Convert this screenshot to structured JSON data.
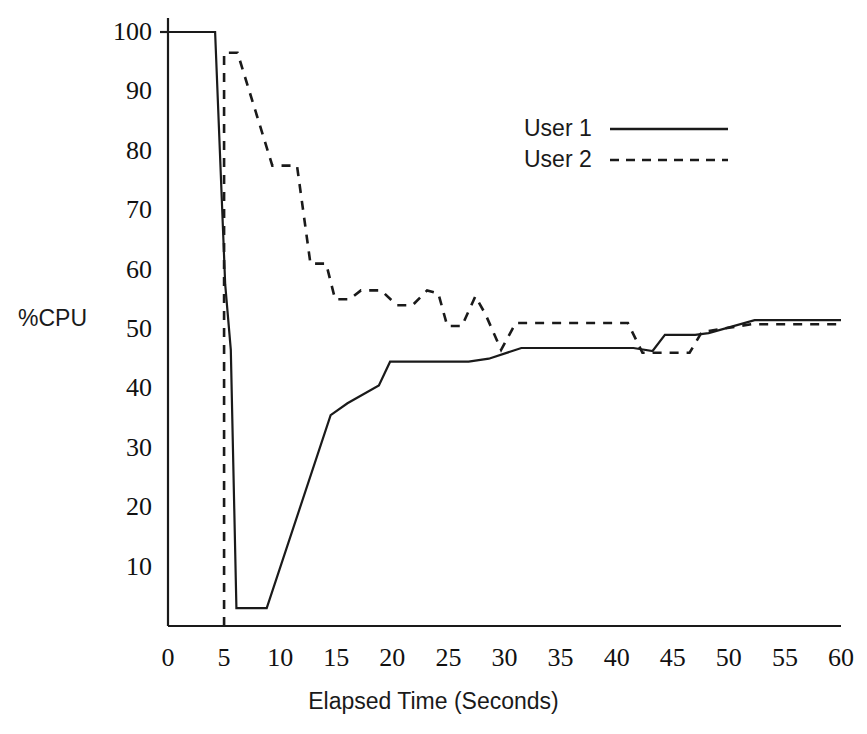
{
  "chart_data": {
    "type": "line",
    "title": "",
    "xlabel": "Elapsed Time (Seconds)",
    "ylabel": "%CPU",
    "xlim": [
      0,
      60
    ],
    "ylim": [
      0,
      103
    ],
    "grid": false,
    "legend_position": "upper-right-inside",
    "xticks": [
      0,
      5,
      10,
      15,
      20,
      25,
      30,
      35,
      40,
      45,
      50,
      55,
      60
    ],
    "xtick_labels": [
      "0",
      "5",
      "10",
      "15",
      "20",
      "25",
      "30",
      "35",
      "40",
      "45",
      "50",
      "55",
      "60"
    ],
    "yticks": [
      10,
      20,
      30,
      40,
      50,
      60,
      70,
      80,
      90,
      100
    ],
    "ytick_labels": [
      "10",
      "20",
      "30",
      "40",
      "50",
      "60",
      "70",
      "80",
      "90",
      "100"
    ],
    "series": [
      {
        "name": "User 1",
        "style": "solid",
        "color": "#1a1a1a",
        "points": [
          [
            0.0,
            100.0
          ],
          [
            4.2,
            100.0
          ],
          [
            5.1,
            57.5
          ],
          [
            5.6,
            46.5
          ],
          [
            6.1,
            3.0
          ],
          [
            8.8,
            3.0
          ],
          [
            14.5,
            35.5
          ],
          [
            16.0,
            37.5
          ],
          [
            18.8,
            40.5
          ],
          [
            19.8,
            44.5
          ],
          [
            26.8,
            44.5
          ],
          [
            28.6,
            45.0
          ],
          [
            31.5,
            46.8
          ],
          [
            41.5,
            46.8
          ],
          [
            43.2,
            46.3
          ],
          [
            44.3,
            49.0
          ],
          [
            47.0,
            49.0
          ],
          [
            48.2,
            49.3
          ],
          [
            52.3,
            51.5
          ],
          [
            60.0,
            51.5
          ]
        ]
      },
      {
        "name": "User 2",
        "style": "dashed",
        "color": "#1a1a1a",
        "points": [
          [
            5.0,
            0.0
          ],
          [
            5.0,
            96.5
          ],
          [
            6.2,
            96.5
          ],
          [
            9.3,
            77.5
          ],
          [
            11.5,
            77.5
          ],
          [
            12.7,
            61.0
          ],
          [
            14.1,
            61.0
          ],
          [
            14.9,
            55.0
          ],
          [
            16.2,
            55.0
          ],
          [
            17.2,
            56.5
          ],
          [
            19.0,
            56.5
          ],
          [
            20.4,
            54.0
          ],
          [
            21.8,
            54.0
          ],
          [
            23.1,
            56.5
          ],
          [
            24.1,
            56.0
          ],
          [
            24.9,
            50.5
          ],
          [
            26.2,
            50.5
          ],
          [
            27.4,
            55.5
          ],
          [
            28.3,
            52.5
          ],
          [
            29.7,
            46.5
          ],
          [
            31.0,
            51.0
          ],
          [
            41.0,
            51.0
          ],
          [
            42.3,
            46.0
          ],
          [
            46.5,
            46.0
          ],
          [
            47.6,
            49.5
          ],
          [
            52.0,
            50.8
          ],
          [
            60.0,
            50.8
          ]
        ]
      }
    ]
  },
  "legend": {
    "items": [
      {
        "label": "User 1",
        "style": "solid"
      },
      {
        "label": "User 2",
        "style": "dashed"
      }
    ]
  }
}
